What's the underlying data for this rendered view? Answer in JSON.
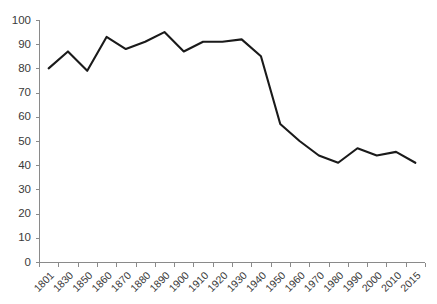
{
  "chart_data": {
    "type": "line",
    "title": "",
    "subtitle": "",
    "xlabel": "",
    "ylabel": "",
    "ylim": [
      0,
      100
    ],
    "ytick_step": 10,
    "grid": false,
    "legend": false,
    "legend_position": "none",
    "line_color": "#1a1a1a",
    "axis_color": "#8a8a8a",
    "tick_label_color": "#3a3a3a",
    "background_color": "#ffffff",
    "categories": [
      "1801",
      "1830",
      "1850",
      "1860",
      "1870",
      "1880",
      "1890",
      "1900",
      "1910",
      "1920",
      "1930",
      "1940",
      "1950",
      "1960",
      "1970",
      "1980",
      "1990",
      "2000",
      "2010",
      "2015"
    ],
    "values": [
      80,
      87,
      79,
      93,
      88,
      91,
      95,
      87,
      91,
      91,
      92,
      85,
      57,
      50,
      44,
      41,
      47,
      44,
      45.5,
      41
    ],
    "ytick_labels": [
      "0",
      "10",
      "20",
      "30",
      "40",
      "50",
      "60",
      "70",
      "80",
      "90",
      "100"
    ],
    "ytick_values": [
      0,
      10,
      20,
      30,
      40,
      50,
      60,
      70,
      80,
      90,
      100
    ],
    "series": [
      {
        "name": "",
        "values": [
          80,
          87,
          79,
          93,
          88,
          91,
          95,
          87,
          91,
          91,
          92,
          85,
          57,
          50,
          44,
          41,
          47,
          44,
          45.5,
          41
        ]
      }
    ],
    "annotations": []
  }
}
